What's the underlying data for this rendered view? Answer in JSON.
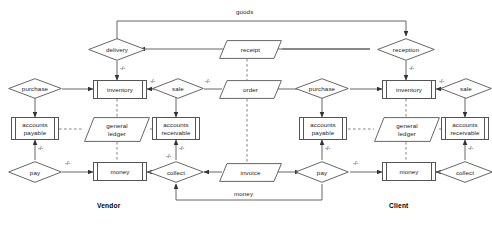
{
  "diagram": {
    "stroke_color": "#555555",
    "text_color": "#1a1a1a",
    "background": "#ffffff",
    "actors": [
      {
        "id": "vendor",
        "label": "Vendor"
      },
      {
        "id": "client",
        "label": "Client"
      }
    ],
    "entities": [
      {
        "id": "inventory_v",
        "label": "inventory"
      },
      {
        "id": "ap_v",
        "label": "accounts\npayable",
        "line1": "accounts",
        "line2": "payable"
      },
      {
        "id": "ar_v",
        "label": "accounts\nreceivable",
        "line1": "accounts",
        "line2": "receivable"
      },
      {
        "id": "money_v",
        "label": "money"
      },
      {
        "id": "inventory_c",
        "label": "inventory"
      },
      {
        "id": "ap_c",
        "label": "accounts\npayable",
        "line1": "accounts",
        "line2": "payable"
      },
      {
        "id": "ar_c",
        "label": "accounts\nreceivable",
        "line1": "accounts",
        "line2": "receivable"
      },
      {
        "id": "money_c",
        "label": "money"
      }
    ],
    "relationships": [
      {
        "id": "delivery",
        "label": "delivery"
      },
      {
        "id": "reception",
        "label": "reception"
      },
      {
        "id": "purchase_v",
        "label": "purchase"
      },
      {
        "id": "sale_v",
        "label": "sale"
      },
      {
        "id": "purchase_c",
        "label": "purchase"
      },
      {
        "id": "sale_c",
        "label": "sale"
      },
      {
        "id": "pay_v",
        "label": "pay"
      },
      {
        "id": "collect_v",
        "label": "collect"
      },
      {
        "id": "pay_c",
        "label": "pay"
      },
      {
        "id": "collect_c",
        "label": "collect"
      }
    ],
    "documents": [
      {
        "id": "receipt",
        "label": "receipt"
      },
      {
        "id": "order",
        "label": "order"
      },
      {
        "id": "invoice",
        "label": "invoice"
      },
      {
        "id": "gl_v",
        "label": "general\nledger",
        "line1": "general",
        "line2": "ledger"
      },
      {
        "id": "gl_c",
        "label": "general\nledger",
        "line1": "general",
        "line2": "ledger"
      }
    ],
    "flow_labels": [
      {
        "id": "goods",
        "label": "goods"
      },
      {
        "id": "money_flow",
        "label": "money"
      }
    ],
    "cardinalities": [
      {
        "id": "c1",
        "label": "-/-"
      },
      {
        "id": "c2",
        "label": "-/-"
      },
      {
        "id": "c3",
        "label": "-/-"
      },
      {
        "id": "c4",
        "label": "-/-"
      },
      {
        "id": "c5",
        "label": "-/-"
      },
      {
        "id": "c6",
        "label": "-/-"
      },
      {
        "id": "c7",
        "label": "-/-"
      },
      {
        "id": "c8",
        "label": "-/-"
      },
      {
        "id": "c9",
        "label": "-/-"
      },
      {
        "id": "c10",
        "label": "-/-"
      },
      {
        "id": "c11",
        "label": "-/-"
      },
      {
        "id": "c12",
        "label": "-/-"
      }
    ]
  }
}
